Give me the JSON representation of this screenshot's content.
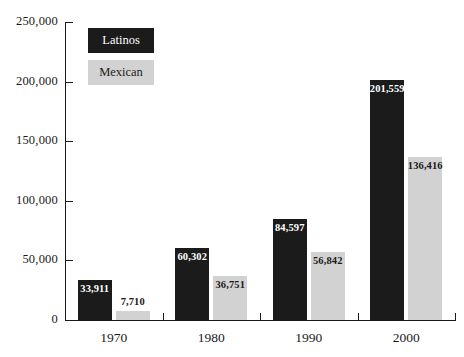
{
  "chart_data": {
    "type": "bar",
    "title": "",
    "xlabel": "",
    "ylabel": "",
    "categories": [
      "1970",
      "1980",
      "1990",
      "2000"
    ],
    "series": [
      {
        "name": "Latinos",
        "color": "#1b1b1b",
        "values": [
          33911,
          60302,
          84597,
          201559
        ],
        "value_labels": [
          "33,911",
          "60,302",
          "84,597",
          "201,559"
        ]
      },
      {
        "name": "Mexican",
        "color": "#d2d2d2",
        "values": [
          7710,
          36751,
          56842,
          136416
        ],
        "value_labels": [
          "7,710",
          "36,751",
          "56,842",
          "136,416"
        ]
      }
    ],
    "ylim": [
      0,
      250000
    ],
    "ytick_values": [
      0,
      50000,
      100000,
      150000,
      200000,
      250000
    ],
    "ytick_labels": [
      "0",
      "50,000",
      "100,000",
      "150,000",
      "200,000",
      "250,000"
    ],
    "grid": false,
    "legend_position": "top-left"
  },
  "legend": {
    "items": [
      {
        "label": "Latinos"
      },
      {
        "label": "Mexican"
      }
    ]
  }
}
